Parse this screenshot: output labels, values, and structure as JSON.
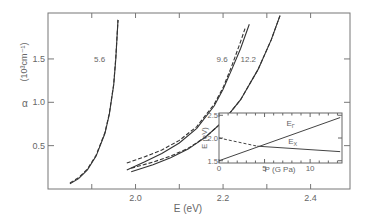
{
  "chart_data": [
    {
      "type": "line",
      "title": "",
      "xlabel": "E (eV)",
      "ylabel": "α (10³cm⁻¹)",
      "ylabel_symbol": "α",
      "ylabel_unit": "(10³cm⁻¹)",
      "xlim": [
        1.8,
        2.49
      ],
      "ylim": [
        0,
        2.03
      ],
      "xticks": [
        2.0,
        2.2,
        2.4
      ],
      "xtick_labels": [
        "2.0",
        "2.2",
        "2.4"
      ],
      "yticks": [
        0.5,
        1.0,
        1.5
      ],
      "ytick_labels": [
        "0.5",
        "1.0",
        "1.5"
      ],
      "grid": false,
      "series": [
        {
          "name": "5.6",
          "style": "solid",
          "x": [
            1.85,
            1.87,
            1.89,
            1.91,
            1.93,
            1.94,
            1.95,
            1.955,
            1.96
          ],
          "values": [
            0.06,
            0.12,
            0.22,
            0.38,
            0.64,
            0.86,
            1.2,
            1.5,
            1.95
          ]
        },
        {
          "name": "5.6 (fit)",
          "style": "dashed",
          "x": [
            1.85,
            1.87,
            1.89,
            1.91,
            1.93,
            1.94,
            1.95,
            1.955,
            1.96
          ],
          "values": [
            0.07,
            0.13,
            0.23,
            0.39,
            0.65,
            0.87,
            1.21,
            1.52,
            1.95
          ]
        },
        {
          "name": "9.6",
          "style": "solid",
          "x": [
            1.98,
            2.02,
            2.06,
            2.1,
            2.14,
            2.18,
            2.2,
            2.22,
            2.24,
            2.26
          ],
          "values": [
            0.22,
            0.31,
            0.41,
            0.53,
            0.7,
            0.96,
            1.15,
            1.38,
            1.62,
            1.9
          ]
        },
        {
          "name": "9.6 (fit)",
          "style": "dashed",
          "x": [
            1.98,
            2.02,
            2.06,
            2.1,
            2.14,
            2.18,
            2.2,
            2.22,
            2.24,
            2.25
          ],
          "values": [
            0.3,
            0.37,
            0.45,
            0.56,
            0.72,
            0.98,
            1.17,
            1.42,
            1.7,
            1.85
          ]
        },
        {
          "name": "12.2",
          "style": "solid",
          "x": [
            1.99,
            2.04,
            2.08,
            2.12,
            2.16,
            2.2,
            2.24,
            2.28,
            2.31,
            2.33
          ],
          "values": [
            0.2,
            0.28,
            0.36,
            0.46,
            0.6,
            0.78,
            1.03,
            1.38,
            1.72,
            2.0
          ]
        },
        {
          "name": "12.2 (fit)",
          "style": "dashed",
          "x": [
            1.99,
            2.04,
            2.08,
            2.12,
            2.16,
            2.2,
            2.24,
            2.28,
            2.31,
            2.33
          ],
          "values": [
            0.24,
            0.31,
            0.38,
            0.47,
            0.6,
            0.78,
            1.03,
            1.38,
            1.72,
            2.0
          ]
        }
      ],
      "annotations": [
        {
          "text": "5.6",
          "x": 1.935,
          "y": 1.5
        },
        {
          "text": "9.6",
          "x": 2.215,
          "y": 1.5
        },
        {
          "text": "12.2",
          "x": 2.28,
          "y": 1.5
        }
      ]
    },
    {
      "type": "line",
      "title": "inset",
      "xlabel": "P (G Pa)",
      "ylabel": "E (eV)",
      "xlim": [
        0,
        13.5
      ],
      "ylim": [
        1.45,
        2.55
      ],
      "xticks": [
        0,
        5,
        10
      ],
      "xtick_labels": [
        "0",
        "5",
        "10"
      ],
      "yticks": [
        1.5,
        2.0,
        2.5
      ],
      "ytick_labels": [
        "1.5",
        "2.0",
        "2.5"
      ],
      "grid": false,
      "series": [
        {
          "name": "EΓ",
          "label_main": "E",
          "label_sub": "Γ",
          "style": "solid",
          "x": [
            0,
            13.3
          ],
          "values": [
            1.5,
            2.45
          ]
        },
        {
          "name": "EX",
          "label_main": "E",
          "label_sub": "X",
          "style": "dashed-then-solid",
          "x": [
            0,
            4.2,
            13.3
          ],
          "values": [
            2.0,
            1.82,
            1.7
          ]
        }
      ],
      "crossover": {
        "x": 4.2,
        "y": 1.82
      }
    }
  ]
}
